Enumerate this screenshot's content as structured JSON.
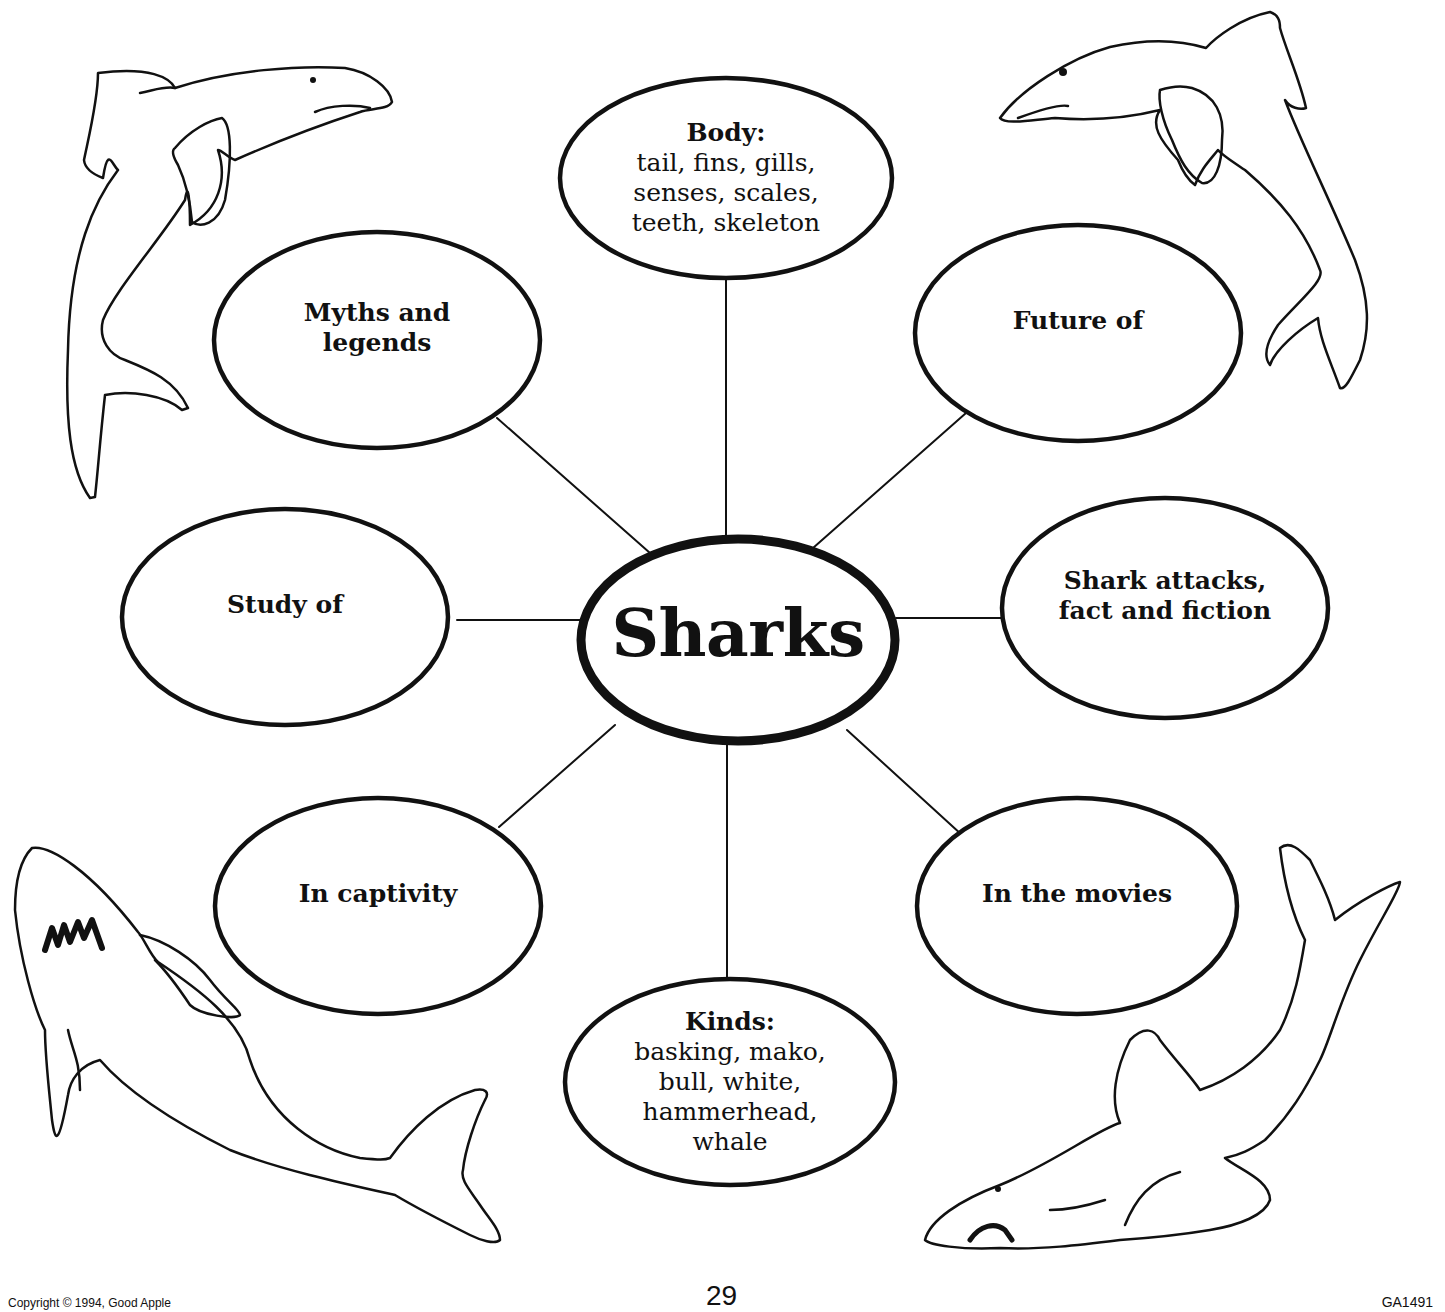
{
  "diagram": {
    "type": "concept-web",
    "center": {
      "label": "Sharks",
      "cx": 738,
      "cy": 640,
      "rx": 157,
      "ry": 101
    },
    "nodes": [
      {
        "id": "body",
        "title": "Body:",
        "detail": [
          "tail, fins, gills,",
          "senses, scales,",
          "teeth, skeleton"
        ],
        "cx": 726,
        "cy": 178,
        "rx": 166,
        "ry": 100,
        "line": [
          726,
          278,
          726,
          539
        ]
      },
      {
        "id": "future",
        "title": "Future of",
        "detail": [],
        "cx": 1078,
        "cy": 333,
        "rx": 163,
        "ry": 108,
        "line": [
          966,
          413,
          813,
          548
        ]
      },
      {
        "id": "shark-attacks",
        "title": "Shark attacks, fact and fiction",
        "title_lines": [
          "Shark attacks,",
          "fact and fiction"
        ],
        "detail": [],
        "cx": 1165,
        "cy": 608,
        "rx": 163,
        "ry": 110,
        "line": [
          1002,
          618,
          896,
          618
        ]
      },
      {
        "id": "movies",
        "title": "In the movies",
        "detail": [],
        "cx": 1077,
        "cy": 906,
        "rx": 160,
        "ry": 108,
        "line": [
          962,
          835,
          847,
          730
        ]
      },
      {
        "id": "kinds",
        "title": "Kinds:",
        "detail": [
          "basking, mako,",
          "bull, white,",
          "hammerhead,",
          "whale"
        ],
        "cx": 730,
        "cy": 1082,
        "rx": 165,
        "ry": 103,
        "line": [
          727,
          979,
          727,
          741
        ]
      },
      {
        "id": "captivity",
        "title": "In captivity",
        "detail": [],
        "cx": 378,
        "cy": 906,
        "rx": 163,
        "ry": 108,
        "line": [
          499,
          827,
          615,
          725
        ]
      },
      {
        "id": "study",
        "title": "Study of",
        "detail": [],
        "cx": 285,
        "cy": 617,
        "rx": 163,
        "ry": 108,
        "line": [
          457,
          620,
          580,
          620
        ]
      },
      {
        "id": "myths",
        "title": "Myths and legends",
        "title_lines": [
          "Myths and",
          "legends"
        ],
        "detail": [],
        "cx": 377,
        "cy": 340,
        "rx": 163,
        "ry": 108,
        "line": [
          497,
          418,
          650,
          553
        ]
      }
    ]
  },
  "illustrations": [
    {
      "id": "shark-top-left",
      "label": "leaping shark drawing"
    },
    {
      "id": "shark-top-right",
      "label": "leaping shark drawing"
    },
    {
      "id": "shark-bottom-left",
      "label": "great white shark with teeth drawing"
    },
    {
      "id": "shark-bottom-right",
      "label": "swimming shark drawing"
    }
  ],
  "footer": {
    "copyright": "Copyright © 1994, Good Apple",
    "page_number": "29",
    "code": "GA1491"
  },
  "colors": {
    "ink": "#111111",
    "paper": "#ffffff"
  }
}
